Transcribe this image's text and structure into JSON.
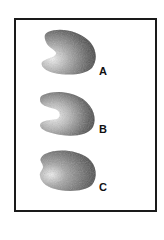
{
  "figure": {
    "frame": {
      "border_color": "#1a1a1a",
      "background": "#ffffff"
    },
    "specimens": [
      {
        "id": "A",
        "label": "A",
        "shape": "kidney-shaped grain, dorsal ridge on right, pale notch on left"
      },
      {
        "id": "B",
        "label": "B",
        "shape": "crescent/horseshoe-shaped grain, pale hollow on left"
      },
      {
        "id": "C",
        "label": "C",
        "shape": "oval grain with pale left end"
      }
    ],
    "colors": {
      "dark": "#3a3a3a",
      "mid": "#7a7a7a",
      "light": "#d8d8d8",
      "label": "#111111"
    }
  }
}
